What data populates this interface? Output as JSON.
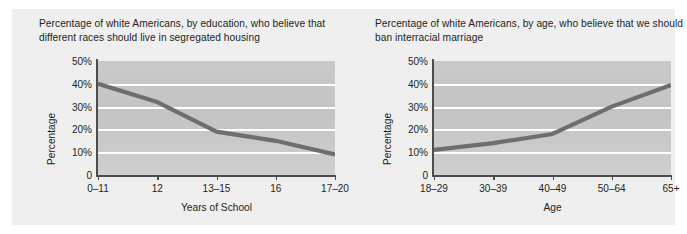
{
  "figure": {
    "background": "#ffffff",
    "card_background": "#efefef",
    "plot_background": "#c7c7c7",
    "gridline_color": "#ffffff",
    "axis_color": "#4c4c4c",
    "series_color": "#6e6e6e"
  },
  "chart_data": [
    {
      "type": "line",
      "id": "education-segregated-housing",
      "title": "Percentage of white Americans, by education, who believe that different races should live in segregated housing",
      "xlabel": "Years of School",
      "ylabel": "Percentage",
      "categories": [
        "0–11",
        "12",
        "13–15",
        "16",
        "17–20"
      ],
      "values": [
        40,
        32,
        19,
        15,
        9
      ],
      "ylim": [
        0,
        50
      ],
      "yticks": [
        0,
        10,
        20,
        30,
        40,
        50
      ],
      "ytick_labels": [
        "0",
        "10%",
        "20%",
        "30%",
        "40%",
        "50%"
      ],
      "grid": true,
      "legend": "none"
    },
    {
      "type": "line",
      "id": "age-ban-interracial-marriage",
      "title": "Percentage of white Americans, by age, who believe that we should ban interracial marriage",
      "xlabel": "Age",
      "ylabel": "Percentage",
      "categories": [
        "18–29",
        "30–39",
        "40–49",
        "50–64",
        "65+"
      ],
      "values": [
        11,
        14,
        18,
        30,
        39.5
      ],
      "ylim": [
        0,
        50
      ],
      "yticks": [
        0,
        10,
        20,
        30,
        40,
        50
      ],
      "ytick_labels": [
        "0",
        "10%",
        "20%",
        "30%",
        "40%",
        "50%"
      ],
      "grid": true,
      "legend": "none"
    }
  ]
}
